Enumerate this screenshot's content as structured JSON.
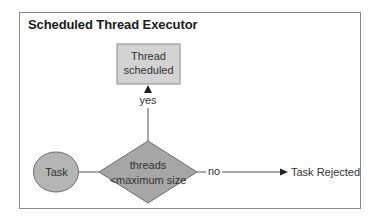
{
  "diagram": {
    "title": "Scheduled Thread Executor",
    "nodes": {
      "task": {
        "label": "Task",
        "shape": "ellipse",
        "fill": "#b4b4b4"
      },
      "decision": {
        "line1": "threads",
        "line2": "<maximum size",
        "shape": "diamond",
        "fill": "#a6a6a6"
      },
      "scheduled": {
        "line1": "Thread",
        "line2": "scheduled",
        "shape": "rectangle",
        "fill": "#d3d3d3"
      },
      "rejected": {
        "label": "Task Rejected",
        "shape": "text"
      }
    },
    "edges": {
      "yes_label": "yes",
      "no_label": "no"
    },
    "colors": {
      "border": "#8a8a8a",
      "line": "#555555",
      "text": "#333333"
    }
  }
}
